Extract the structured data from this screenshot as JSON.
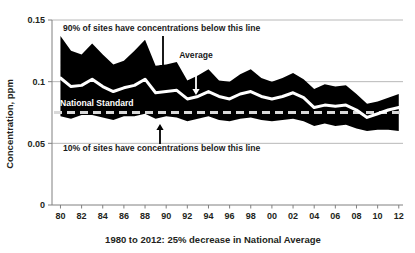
{
  "chart_data": {
    "type": "area",
    "title": "",
    "subtitle": "",
    "xlabel": "1980 to 2012: 25% decrease in National Average",
    "ylabel": "Concentration, ppm",
    "xlim": [
      1979.2,
      2012.4
    ],
    "ylim": [
      0,
      0.15
    ],
    "grid": true,
    "grid_axis": "y",
    "legend_position": "none",
    "y_ticks": [
      "0",
      "0.05",
      "0.1",
      "0.15"
    ],
    "y_tick_values": [
      0,
      0.05,
      0.1,
      0.15
    ],
    "x_ticks": [
      "80",
      "82",
      "84",
      "86",
      "88",
      "90",
      "92",
      "94",
      "96",
      "98",
      "00",
      "02",
      "04",
      "06",
      "08",
      "10",
      "12"
    ],
    "x_tick_values": [
      1980,
      1982,
      1984,
      1986,
      1988,
      1990,
      1992,
      1994,
      1996,
      1998,
      2000,
      2002,
      2004,
      2006,
      2008,
      2010,
      2012
    ],
    "x": [
      1980,
      1981,
      1982,
      1983,
      1984,
      1985,
      1986,
      1987,
      1988,
      1989,
      1990,
      1991,
      1992,
      1993,
      1994,
      1995,
      1996,
      1997,
      1998,
      1999,
      2000,
      2001,
      2002,
      2003,
      2004,
      2005,
      2006,
      2007,
      2008,
      2009,
      2010,
      2011,
      2012
    ],
    "series": [
      {
        "name": "90% of sites have concentrations below this line",
        "role": "upper-band",
        "color": "#000000",
        "values": [
          0.137,
          0.125,
          0.122,
          0.131,
          0.122,
          0.114,
          0.117,
          0.125,
          0.134,
          0.113,
          0.114,
          0.116,
          0.101,
          0.105,
          0.11,
          0.101,
          0.1,
          0.106,
          0.11,
          0.103,
          0.1,
          0.103,
          0.107,
          0.102,
          0.094,
          0.098,
          0.096,
          0.097,
          0.09,
          0.082,
          0.084,
          0.087,
          0.09
        ]
      },
      {
        "name": "Average",
        "role": "average-line",
        "color": "#ffffff",
        "values": [
          0.103,
          0.096,
          0.097,
          0.102,
          0.096,
          0.092,
          0.095,
          0.097,
          0.102,
          0.091,
          0.092,
          0.093,
          0.086,
          0.088,
          0.092,
          0.088,
          0.086,
          0.09,
          0.092,
          0.088,
          0.086,
          0.088,
          0.091,
          0.087,
          0.079,
          0.081,
          0.08,
          0.081,
          0.077,
          0.071,
          0.074,
          0.077,
          0.079
        ]
      },
      {
        "name": "10% of sites have concentrations below this line",
        "role": "lower-band",
        "color": "#000000",
        "values": [
          0.072,
          0.07,
          0.073,
          0.073,
          0.071,
          0.069,
          0.072,
          0.072,
          0.074,
          0.07,
          0.072,
          0.071,
          0.068,
          0.07,
          0.072,
          0.069,
          0.068,
          0.07,
          0.071,
          0.069,
          0.068,
          0.069,
          0.07,
          0.068,
          0.064,
          0.066,
          0.064,
          0.065,
          0.062,
          0.06,
          0.061,
          0.061,
          0.06
        ]
      }
    ],
    "reference_lines": [
      {
        "name": "National Standard",
        "label": "National Standard",
        "value": 0.075,
        "style": "dashed",
        "color": "#d9d9d9"
      }
    ],
    "annotations": [
      {
        "id": "upper-band-annotation",
        "text": "90% of sites have concentrations below this line",
        "arrow": "down",
        "arrow_color": "#000000"
      },
      {
        "id": "average-annotation",
        "text": "Average",
        "arrow": "down",
        "arrow_color": "#ffffff"
      },
      {
        "id": "lower-band-annotation",
        "text": "10% of sites have concentrations below this line",
        "arrow": "up",
        "arrow_color": "#000000"
      },
      {
        "id": "national-standard-annotation",
        "text": "National Standard",
        "arrow": "none",
        "arrow_color": "#ffffff"
      }
    ],
    "colors": {
      "band": "#000000",
      "average": "#ffffff",
      "standard": "#d9d9d9",
      "grid": "#a6a6a6",
      "axis": "#808080",
      "text": "#231f20",
      "background": "#ffffff"
    }
  }
}
